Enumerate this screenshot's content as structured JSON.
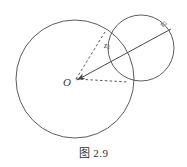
{
  "figure": {
    "caption_prefix": "图",
    "caption_number": "2.9",
    "caption_full": "图 2.9",
    "stroke_color": "#4a4a4a",
    "background_color": "#ffffff",
    "label_color": "#3a3a3a"
  },
  "labels": {
    "origin": "O",
    "z1_base": "z",
    "z1_sub": "1",
    "z2_base": "z",
    "z2_sub": "2"
  },
  "chart_data": {
    "type": "diagram",
    "shapes": [
      {
        "name": "large-circle",
        "kind": "circle",
        "cx": 75,
        "cy": 79,
        "r": 59,
        "stroke": "#4a4a4a",
        "fill": "none",
        "dash": false
      },
      {
        "name": "small-circle",
        "kind": "circle",
        "cx": 141,
        "cy": 48,
        "r": 33,
        "stroke": "#4a4a4a",
        "fill": "none",
        "dash": false
      },
      {
        "name": "z2-vector-arrow",
        "kind": "line",
        "x1": 171,
        "y1": 29,
        "x2": 77,
        "y2": 80,
        "stroke": "#4a4a4a",
        "dash": false,
        "arrowhead_at": "end"
      },
      {
        "name": "dashed-radius-upper",
        "kind": "line",
        "x1": 76,
        "y1": 79,
        "x2": 105,
        "y2": 32,
        "stroke": "#4a4a4a",
        "dash": true,
        "arrowhead_at": "none"
      },
      {
        "name": "dashed-radius-lower",
        "kind": "line",
        "x1": 76,
        "y1": 79,
        "x2": 128,
        "y2": 82,
        "stroke": "#4a4a4a",
        "dash": true,
        "arrowhead_at": "none"
      }
    ],
    "points": [
      {
        "name": "origin",
        "label": "O",
        "x": 75,
        "y": 79
      },
      {
        "name": "intersection-upper",
        "label": "",
        "x": 105,
        "y": 32
      },
      {
        "name": "intersection-lower",
        "label": "",
        "x": 128,
        "y": 82
      }
    ],
    "annotations": [
      {
        "name": "z1-label",
        "text": "z1",
        "x": 110,
        "y": 48
      },
      {
        "name": "z2-label",
        "text": "z2",
        "x": 167,
        "y": 28
      },
      {
        "name": "origin-label",
        "text": "O",
        "x": 70,
        "y": 84
      }
    ]
  }
}
